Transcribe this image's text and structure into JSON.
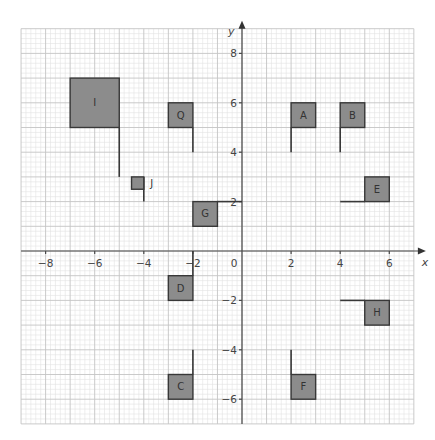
{
  "chart_data": {
    "type": "coordinate-grid",
    "title": "",
    "xlabel": "x",
    "ylabel": "y",
    "xlim": [
      -9,
      7
    ],
    "ylim": [
      -7,
      9
    ],
    "grid": true,
    "minor_step": 0.2,
    "x_ticks": [
      -8,
      -6,
      -4,
      -2,
      0,
      2,
      4,
      6
    ],
    "x_tick_labels": [
      "−8",
      "−6",
      "−4",
      "−2",
      "0",
      "2",
      "4",
      "6"
    ],
    "y_ticks": [
      8,
      6,
      4,
      2,
      -2,
      -4,
      -6
    ],
    "y_tick_labels": [
      "8",
      "6",
      "4",
      "2",
      "−2",
      "−4",
      "−6"
    ],
    "flags": [
      {
        "label": "I",
        "box": [
          -7,
          5,
          -5,
          7
        ],
        "pole": [
          [
            -5,
            5
          ],
          [
            -5,
            3
          ]
        ]
      },
      {
        "label": "Q",
        "box": [
          -3,
          5,
          -2,
          6
        ],
        "pole": [
          [
            -2,
            5
          ],
          [
            -2,
            4
          ]
        ]
      },
      {
        "label": "A",
        "box": [
          2,
          5,
          3,
          6
        ],
        "pole": [
          [
            2,
            5
          ],
          [
            2,
            4
          ]
        ]
      },
      {
        "label": "B",
        "box": [
          4,
          5,
          5,
          6
        ],
        "pole": [
          [
            4,
            5
          ],
          [
            4,
            4
          ]
        ]
      },
      {
        "label": "J",
        "box": [
          -4.5,
          2.5,
          -4,
          3
        ],
        "pole": [
          [
            -4,
            3
          ],
          [
            -4,
            2
          ]
        ],
        "label_outside": true
      },
      {
        "label": "G",
        "box": [
          -2,
          1,
          -1,
          2
        ],
        "pole": [
          [
            -1,
            2
          ],
          [
            0,
            2
          ]
        ]
      },
      {
        "label": "E",
        "box": [
          5,
          2,
          6,
          3
        ],
        "pole": [
          [
            4,
            2
          ],
          [
            5,
            2
          ]
        ]
      },
      {
        "label": "D",
        "box": [
          -3,
          -2,
          -2,
          -1
        ],
        "pole": [
          [
            -2,
            -1
          ],
          [
            -2,
            0
          ]
        ]
      },
      {
        "label": "H",
        "box": [
          5,
          -3,
          6,
          -2
        ],
        "pole": [
          [
            4,
            -2
          ],
          [
            5,
            -2
          ]
        ]
      },
      {
        "label": "C",
        "box": [
          -3,
          -6,
          -2,
          -5
        ],
        "pole": [
          [
            -2,
            -5
          ],
          [
            -2,
            -4
          ]
        ]
      },
      {
        "label": "F",
        "box": [
          2,
          -6,
          3,
          -5
        ],
        "pole": [
          [
            2,
            -5
          ],
          [
            2,
            -4
          ]
        ]
      }
    ]
  },
  "layout": {
    "origin_px": [
      242,
      251
    ],
    "unit_px": [
      24.55,
      24.7
    ],
    "fill_color": "#8c8c8c",
    "stroke_color": "#383838"
  }
}
